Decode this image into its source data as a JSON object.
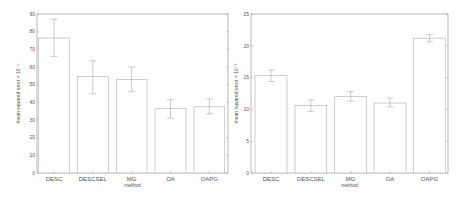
{
  "chart_data": [
    {
      "type": "bar",
      "title": "",
      "xlabel": "method",
      "ylabel": "mean squared error × 10^-6",
      "categories": [
        "DESC",
        "DESCSEL",
        "MG",
        "OA",
        "OAPG"
      ],
      "values": [
        76.4,
        54.7,
        53.0,
        36.6,
        37.5
      ],
      "error_upper": [
        87.0,
        63.5,
        60.0,
        41.5,
        42.0
      ],
      "error_lower": [
        66.0,
        44.8,
        46.0,
        31.0,
        33.5
      ],
      "ylim": [
        0,
        90
      ],
      "yticks": [
        0,
        10,
        20,
        30,
        40,
        50,
        60,
        70,
        80,
        90
      ],
      "grid": false,
      "legend": null
    },
    {
      "type": "bar",
      "title": "",
      "xlabel": "method",
      "ylabel": "mean squared error × 10^-2",
      "categories": [
        "DESC",
        "DESCSEL",
        "MG",
        "OA",
        "OAPG"
      ],
      "values": [
        15.3,
        10.6,
        12.0,
        11.0,
        21.2
      ],
      "error_upper": [
        16.2,
        11.5,
        12.8,
        11.8,
        21.8
      ],
      "error_lower": [
        14.4,
        9.7,
        11.3,
        10.4,
        20.6
      ],
      "ylim": [
        0,
        25
      ],
      "yticks": [
        0,
        5,
        10,
        15,
        20,
        25
      ],
      "grid": false,
      "legend": null
    }
  ],
  "charts": [
    {
      "xlabel": "method",
      "ylabel": "mean squared error × 10⁻⁶"
    },
    {
      "xlabel": "method",
      "ylabel": "mean squared error × 10⁻²"
    }
  ],
  "colors": {
    "bar_fill": "#ffffff",
    "bar_stroke": "#b8b8b8",
    "axis": "#9a9a9a",
    "error": "#aaaaaa",
    "text": "#555555"
  }
}
